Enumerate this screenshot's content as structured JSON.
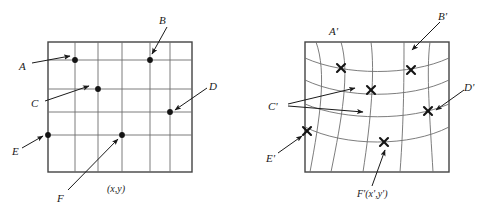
{
  "figure": {
    "background_color": "#ffffff",
    "ink_color": "#1a1a1a",
    "grid_color": "#6e6e6e",
    "border_color": "#444444",
    "width": 496,
    "height": 219
  },
  "left_panel": {
    "name": "source-grid-panel",
    "caption": "(x,y)",
    "box": {
      "x": 48,
      "y": 42,
      "w": 144,
      "h": 130
    },
    "grid": {
      "columns": 5,
      "rows": 5,
      "type": "regular-rectilinear"
    },
    "labels": [
      {
        "id": "A",
        "text": "A",
        "x": 20,
        "y": 62,
        "point_x": 75,
        "point_y": 60
      },
      {
        "id": "B",
        "text": "B",
        "x": 160,
        "y": 16,
        "point_x": 150,
        "point_y": 60
      },
      {
        "id": "C",
        "text": "C",
        "x": 32,
        "y": 99,
        "point_x": 98,
        "point_y": 89
      },
      {
        "id": "D",
        "text": "D",
        "x": 209,
        "y": 82,
        "point_x": 170,
        "point_y": 112
      },
      {
        "id": "E",
        "text": "E",
        "x": 13,
        "y": 147,
        "point_x": 48,
        "point_y": 135
      },
      {
        "id": "F",
        "text": "F",
        "x": 58,
        "y": 194,
        "point_x": 122,
        "point_y": 135
      }
    ],
    "control_points": [
      {
        "id": "A",
        "x": 75,
        "y": 60,
        "marker": "dot"
      },
      {
        "id": "B",
        "x": 150,
        "y": 60,
        "marker": "dot"
      },
      {
        "id": "C",
        "x": 98,
        "y": 89,
        "marker": "dot"
      },
      {
        "id": "D",
        "x": 170,
        "y": 112,
        "marker": "dot"
      },
      {
        "id": "E",
        "x": 48,
        "y": 135,
        "marker": "dot"
      },
      {
        "id": "F",
        "x": 122,
        "y": 135,
        "marker": "dot"
      }
    ]
  },
  "right_panel": {
    "name": "warped-grid-panel",
    "caption": "F'(x',y')",
    "box": {
      "x": 305,
      "y": 42,
      "w": 144,
      "h": 130
    },
    "grid": {
      "columns": 5,
      "rows": 5,
      "type": "warped-curvilinear"
    },
    "labels": [
      {
        "id": "A'",
        "text": "A'",
        "x": 331,
        "y": 28,
        "point_x": 331,
        "point_y": 42
      },
      {
        "id": "B'",
        "text": "B'",
        "x": 440,
        "y": 12,
        "point_x": 403,
        "point_y": 46
      },
      {
        "id": "C'",
        "text": "C'",
        "x": 270,
        "y": 103,
        "point_x": 347,
        "point_y": 94
      },
      {
        "id": "D'",
        "text": "D'",
        "x": 466,
        "y": 84,
        "point_x": 428,
        "point_y": 111
      },
      {
        "id": "E'",
        "text": "E'",
        "x": 268,
        "y": 155,
        "point_x": 307,
        "point_y": 131
      },
      {
        "id": "F'",
        "text": "F'(x',y')",
        "x": 365,
        "y": 192,
        "point_x": 384,
        "point_y": 142
      }
    ],
    "control_points": [
      {
        "id": "A'",
        "x": 341,
        "y": 68,
        "marker": "cross"
      },
      {
        "id": "B'",
        "x": 411,
        "y": 70,
        "marker": "cross"
      },
      {
        "id": "C'",
        "x": 371,
        "y": 90,
        "marker": "cross"
      },
      {
        "id": "D'",
        "x": 428,
        "y": 111,
        "marker": "cross"
      },
      {
        "id": "E'",
        "x": 307,
        "y": 131,
        "marker": "cross"
      },
      {
        "id": "F'",
        "x": 384,
        "y": 142,
        "marker": "cross"
      }
    ]
  }
}
